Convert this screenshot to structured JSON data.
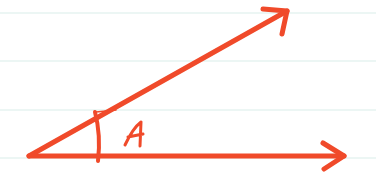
{
  "diagram": {
    "type": "angle",
    "angle_label": "A",
    "colors": {
      "stroke": "#F04A2A",
      "ruled_line": "#E6F3F1",
      "background": "#FFFFFF"
    },
    "vertex": [
      29,
      156
    ],
    "rays": [
      {
        "name": "upper-ray",
        "end": [
          287,
          11
        ]
      },
      {
        "name": "lower-ray",
        "end": [
          344,
          156
        ]
      }
    ],
    "ruled_lines_y": [
      13,
      61,
      110,
      158
    ]
  }
}
